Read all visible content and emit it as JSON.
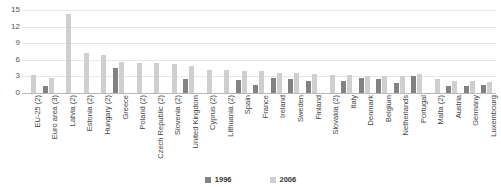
{
  "chart_data": {
    "type": "bar",
    "title": "",
    "subtitle": "",
    "xlabel": "",
    "ylabel": "",
    "ylim": [
      0,
      15
    ],
    "yticks": [
      0,
      3,
      6,
      9,
      12,
      15
    ],
    "grid": true,
    "legend_position": "bottom-center",
    "categories": [
      "EU-25 (2)",
      "Euro area (3)",
      "Latvia (2)",
      "Estonia (2)",
      "Hungary (2)",
      "Greece",
      "Poland (2)",
      "Czech Republic (2)",
      "Slovenia (2)",
      "United Kingdom",
      "Cyprus (2)",
      "Lithuania (2)",
      "Spain",
      "France",
      "Ireland",
      "Sweden",
      "Finland",
      "Slovakia (2)",
      "Italy",
      "Denmark",
      "Belgium",
      "Netherlands",
      "Portugal",
      "Malta (2)",
      "Austria",
      "Germany",
      "Luxembourg"
    ],
    "series": [
      {
        "name": "1996",
        "color": "#828282",
        "values": [
          null,
          1.3,
          null,
          null,
          null,
          4.6,
          null,
          null,
          null,
          2.6,
          null,
          null,
          2.3,
          1.5,
          2.7,
          2.6,
          2.2,
          null,
          2.2,
          2.7,
          2.6,
          1.9,
          3.0,
          null,
          1.3,
          1.3,
          1.4
        ]
      },
      {
        "name": "2006",
        "color": "#cfcfcf",
        "values": [
          3.2,
          2.8,
          14.2,
          7.3,
          6.8,
          5.6,
          5.5,
          5.5,
          5.3,
          4.8,
          4.2,
          4.1,
          4.0,
          3.9,
          3.7,
          3.6,
          3.4,
          3.3,
          3.2,
          3.1,
          3.1,
          3.0,
          3.4,
          2.6,
          2.1,
          2.1,
          2.0
        ]
      }
    ]
  },
  "legend": {
    "items": [
      {
        "label": "1996",
        "color": "#828282"
      },
      {
        "label": "2006",
        "color": "#cfcfcf"
      }
    ]
  }
}
